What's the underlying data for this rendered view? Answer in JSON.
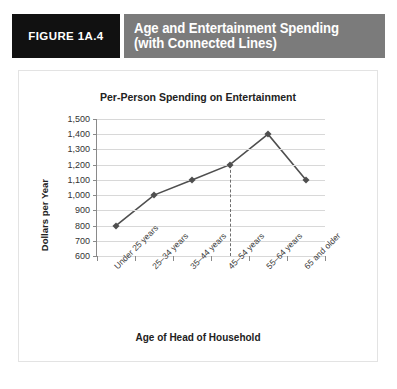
{
  "figure": {
    "tag": "FIGURE 1A.4",
    "title_line1": "Age and Entertainment Spending",
    "title_line2": "(with Connected Lines)",
    "tag_bg": "#111111",
    "title_bg": "#7b7b7b",
    "title_fg": "#ffffff"
  },
  "chart_data": {
    "type": "line",
    "title": "Per-Person Spending on Entertainment",
    "xlabel": "Age of Head of Household",
    "ylabel": "Dollars per Year",
    "categories": [
      "Under 25 years",
      "25–34 years",
      "35–44 years",
      "45–54 years",
      "55–64 years",
      "65 and older"
    ],
    "values": [
      800,
      1000,
      1100,
      1200,
      1400,
      1100
    ],
    "ylim": [
      600,
      1500
    ],
    "ytick_values": [
      1500,
      1400,
      1300,
      1200,
      1100,
      1000,
      900,
      800,
      700,
      600
    ],
    "ytick_labels": [
      "1,500",
      "1,400",
      "1,300",
      "1,200",
      "1,100",
      "1,000",
      "900",
      "800",
      "700",
      "600"
    ],
    "grid": true,
    "legend": null,
    "marker": "diamond",
    "line_color": "#4f4f4f",
    "marker_color": "#4f4f4f",
    "grid_color": "#d8d8d8",
    "annotations": [
      {
        "type": "dashed-vertical-reference-line",
        "category": "45–54 years",
        "from_value": 1200,
        "to_value": 600,
        "color": "#6e6e6e"
      }
    ]
  }
}
